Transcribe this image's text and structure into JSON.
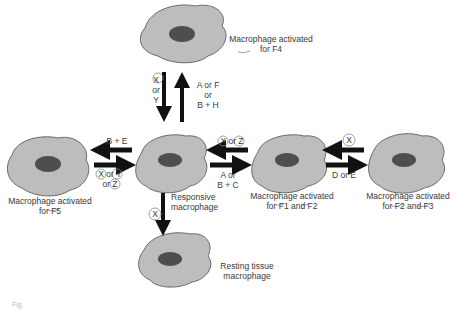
{
  "cells": {
    "f4": {
      "label_line1": "Macrophage activated",
      "label_line2": "for F4"
    },
    "f5": {
      "label_line1": "Macrophage activated",
      "label_line2": "for F5"
    },
    "responsive": {
      "label_line1": "Responsive",
      "label_line2": "macrophage"
    },
    "f1f2": {
      "label_line1": "Macrophage activated",
      "label_line2": "for F1 and F2"
    },
    "f2f3": {
      "label_line1": "Macrophage activated",
      "label_line2": "for F2 and F3"
    },
    "resting": {
      "label_line1": "Resting tissue",
      "label_line2": "macrophage"
    }
  },
  "arrows": {
    "to_f4": {
      "line1": "A or F",
      "line2": "or",
      "line3": "B + H"
    },
    "from_f4": {
      "line1": "X",
      "line2": "or",
      "line3": "Y"
    },
    "to_f5": {
      "line1": "B + E"
    },
    "from_f5": {
      "line1": "X or Y",
      "line2": "or Z"
    },
    "from_f1f2": {
      "line1": "X or Z"
    },
    "to_f1f2": {
      "line1": "A or",
      "line2": "B + C"
    },
    "from_f2f3": {
      "line1": "X"
    },
    "to_f2f3": {
      "line1": "D or E"
    },
    "to_resting": {
      "line1": "X"
    }
  },
  "caption": {
    "text": "Fig."
  },
  "colors": {
    "cell_fill": "#bdbdbd",
    "cell_outline": "#6a6a6a",
    "nucleus": "#4e4e4e",
    "arrow": "#111111"
  }
}
